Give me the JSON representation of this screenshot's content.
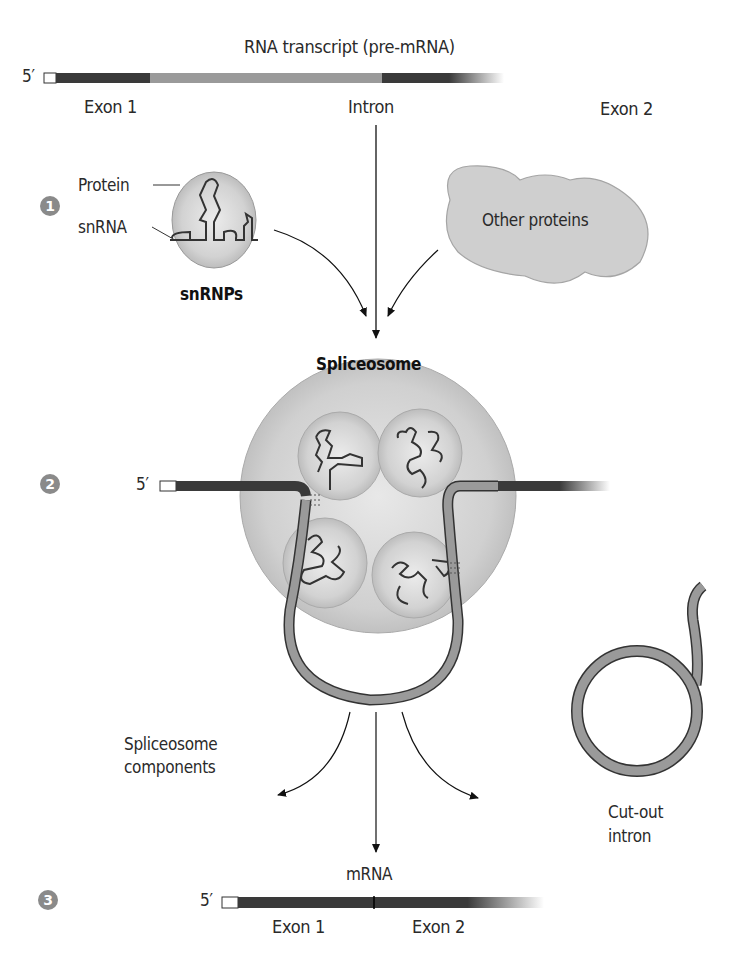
{
  "pre_mrna": {
    "title": "RNA transcript (pre-mRNA)",
    "five_prime": "5′",
    "exon1": "Exon 1",
    "intron": "Intron",
    "exon2": "Exon 2"
  },
  "step1": {
    "number": "1",
    "protein_label": "Protein",
    "snrna_label": "snRNA",
    "snrnps_label": "snRNPs",
    "other_proteins_label": "Other proteins"
  },
  "step2": {
    "number": "2",
    "spliceosome_label": "Spliceosome",
    "five_prime": "5′"
  },
  "products": {
    "components_line1": "Spliceosome",
    "components_line2": "components",
    "intron_line1": "Cut-out",
    "intron_line2": "intron"
  },
  "step3": {
    "number": "3",
    "mrna_label": "mRNA",
    "five_prime": "5′",
    "exon1": "Exon 1",
    "exon2": "Exon 2"
  },
  "colors": {
    "exon": "#3a3a3a",
    "intron": "#9a9a9a",
    "body_fill": "#c8c8c8",
    "step_badge": "#8a8a8a"
  }
}
